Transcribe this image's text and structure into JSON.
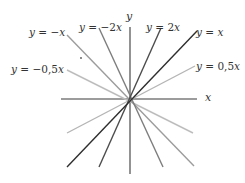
{
  "chart_data": {
    "type": "line",
    "title": "",
    "xlabel": "x",
    "ylabel": "y",
    "grid": false,
    "series": [
      {
        "name": "y = -x",
        "slope": -1,
        "color": "#9a9a9a"
      },
      {
        "name": "y = -2x",
        "slope": -2,
        "color": "#7a7a7a"
      },
      {
        "name": "y = 2x",
        "slope": 2,
        "color": "#4a4a4a"
      },
      {
        "name": "y = x",
        "slope": 1,
        "color": "#2e2e2e"
      },
      {
        "name": "y = -0,5x",
        "slope": -0.5,
        "color": "#b8b8b8"
      },
      {
        "name": "y = 0,5x",
        "slope": 0.5,
        "color": "#b0b0b0"
      }
    ]
  },
  "axes": {
    "x_label": "x",
    "y_label": "y"
  },
  "labels": {
    "neg_x": "y = −x",
    "neg_2x": "y = −2x",
    "pos_2x": "y = 2x",
    "pos_x": "y = x",
    "neg_half_x": "y = −0,5x",
    "pos_half_x": "y = 0,5x"
  }
}
